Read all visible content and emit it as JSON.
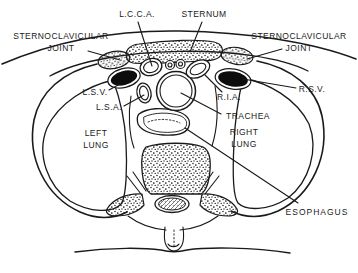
{
  "colors": {
    "ink": "#1a1a1a",
    "paper": "#ffffff",
    "vein_fill": "#0d0d0d"
  },
  "labels": {
    "lcca": "L.C.C.A.",
    "sternum": "STERNUM",
    "scj_left": {
      "line1": "STERNOCLAVICULAR",
      "line2": "JOINT"
    },
    "scj_right": {
      "line1": "STERNOCLAVICULAR",
      "line2": "JOINT"
    },
    "lsv": "L.S.V.",
    "lsa": "L.S.A.",
    "ria": "R.I.A.",
    "rsv": "R.S.V.",
    "trachea": "TRACHEA",
    "left_lung": {
      "line1": "LEFT",
      "line2": "LUNG"
    },
    "right_lung": {
      "line1": "RIGHT",
      "line2": "LUNG"
    },
    "esophagus": "ESOPHAGUS"
  }
}
